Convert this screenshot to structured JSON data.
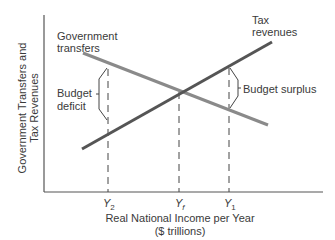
{
  "diagram": {
    "y_axis_label_line1": "Government Transfers and",
    "y_axis_label_line2": "Tax Revenues",
    "x_axis_label_line1": "Real National Income per Year",
    "x_axis_label_line2": "($ trillions)",
    "curves": {
      "government_transfers": {
        "label_line1": "Government",
        "label_line2": "transfers",
        "color": "#8a8a8a"
      },
      "tax_revenues": {
        "label_line1": "Tax",
        "label_line2": "revenues",
        "color": "#555555"
      }
    },
    "annotations": {
      "budget_deficit_line1": "Budget",
      "budget_deficit_line2": "deficit",
      "budget_surplus": "Budget surplus"
    },
    "ticks": {
      "y2": {
        "main": "Y",
        "sub": "2"
      },
      "yf": {
        "main": "Y",
        "sub": "f"
      },
      "y1": {
        "main": "Y",
        "sub": "1"
      }
    }
  }
}
